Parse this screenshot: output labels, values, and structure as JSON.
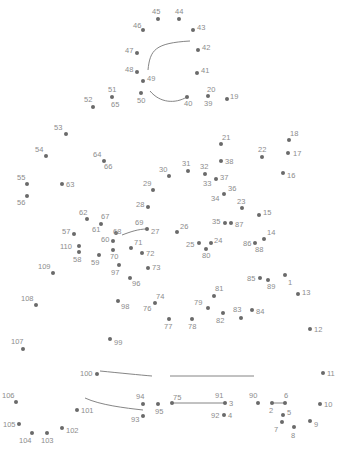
{
  "puzzle": {
    "type": "connect-the-dots",
    "width": 343,
    "height": 451,
    "dot_color": "#6a6a6a",
    "label_color": "#8c8c8c",
    "line_color": "#777777",
    "dots": [
      {
        "n": "1",
        "x": 285,
        "y": 275,
        "lx": 3,
        "ly": 4
      },
      {
        "n": "2",
        "x": 272,
        "y": 403,
        "lx": -3,
        "ly": 4
      },
      {
        "n": "3",
        "x": 225,
        "y": 403,
        "lx": 4,
        "ly": -3
      },
      {
        "n": "4",
        "x": 224,
        "y": 415,
        "lx": 4,
        "ly": -3
      },
      {
        "n": "5",
        "x": 283,
        "y": 415,
        "lx": 4,
        "ly": -6
      },
      {
        "n": "6",
        "x": 285,
        "y": 403,
        "lx": -1,
        "ly": -11
      },
      {
        "n": "7",
        "x": 282,
        "y": 422,
        "lx": -8,
        "ly": 4
      },
      {
        "n": "8",
        "x": 294,
        "y": 427,
        "lx": -3,
        "ly": 5
      },
      {
        "n": "9",
        "x": 310,
        "y": 421,
        "lx": 4,
        "ly": 0
      },
      {
        "n": "10",
        "x": 320,
        "y": 404,
        "lx": 4,
        "ly": -3
      },
      {
        "n": "11",
        "x": 323,
        "y": 373,
        "lx": 4,
        "ly": -3
      },
      {
        "n": "12",
        "x": 310,
        "y": 329,
        "lx": 4,
        "ly": -3
      },
      {
        "n": "13",
        "x": 298,
        "y": 294,
        "lx": 4,
        "ly": -5
      },
      {
        "n": "14",
        "x": 264,
        "y": 239,
        "lx": 3,
        "ly": -10
      },
      {
        "n": "15",
        "x": 259,
        "y": 215,
        "lx": 4,
        "ly": -6
      },
      {
        "n": "16",
        "x": 283,
        "y": 173,
        "lx": 4,
        "ly": -1
      },
      {
        "n": "17",
        "x": 288,
        "y": 153,
        "lx": 5,
        "ly": -3
      },
      {
        "n": "18",
        "x": 289,
        "y": 140,
        "lx": 1,
        "ly": -10
      },
      {
        "n": "19",
        "x": 227,
        "y": 99,
        "lx": 3,
        "ly": -6
      },
      {
        "n": "20",
        "x": 208,
        "y": 96,
        "lx": -1,
        "ly": -10
      },
      {
        "n": "21",
        "x": 221,
        "y": 144,
        "lx": 1,
        "ly": -10
      },
      {
        "n": "22",
        "x": 262,
        "y": 157,
        "lx": -4,
        "ly": -11
      },
      {
        "n": "23",
        "x": 242,
        "y": 208,
        "lx": -5,
        "ly": -10
      },
      {
        "n": "24",
        "x": 211,
        "y": 243,
        "lx": 3,
        "ly": -6
      },
      {
        "n": "25",
        "x": 199,
        "y": 243,
        "lx": -13,
        "ly": -2
      },
      {
        "n": "26",
        "x": 177,
        "y": 232,
        "lx": 3,
        "ly": -9
      },
      {
        "n": "27",
        "x": 147,
        "y": 229,
        "lx": 4,
        "ly": -1
      },
      {
        "n": "28",
        "x": 148,
        "y": 207,
        "lx": -12,
        "ly": -6
      },
      {
        "n": "29",
        "x": 153,
        "y": 190,
        "lx": -10,
        "ly": -10
      },
      {
        "n": "30",
        "x": 169,
        "y": 176,
        "lx": -10,
        "ly": -10
      },
      {
        "n": "31",
        "x": 188,
        "y": 171,
        "lx": -6,
        "ly": -11
      },
      {
        "n": "32",
        "x": 205,
        "y": 174,
        "lx": -5,
        "ly": -11
      },
      {
        "n": "33",
        "x": 216,
        "y": 179,
        "lx": -13,
        "ly": 1
      },
      {
        "n": "34",
        "x": 224,
        "y": 194,
        "lx": -13,
        "ly": 1
      },
      {
        "n": "35",
        "x": 225,
        "y": 223,
        "lx": -13,
        "ly": -5
      },
      {
        "n": "36",
        "x": 224,
        "y": 194,
        "lx": 4,
        "ly": -9
      },
      {
        "n": "37",
        "x": 216,
        "y": 179,
        "lx": 4,
        "ly": -5
      },
      {
        "n": "38",
        "x": 221,
        "y": 161,
        "lx": 4,
        "ly": -3
      },
      {
        "n": "39",
        "x": 208,
        "y": 96,
        "lx": -4,
        "ly": 4
      },
      {
        "n": "40",
        "x": 187,
        "y": 97,
        "lx": -3,
        "ly": 3
      },
      {
        "n": "41",
        "x": 197,
        "y": 73,
        "lx": 4,
        "ly": -6
      },
      {
        "n": "42",
        "x": 198,
        "y": 50,
        "lx": 4,
        "ly": -6
      },
      {
        "n": "43",
        "x": 193,
        "y": 30,
        "lx": 4,
        "ly": -6
      },
      {
        "n": "44",
        "x": 179,
        "y": 19,
        "lx": -4,
        "ly": -11
      },
      {
        "n": "45",
        "x": 158,
        "y": 19,
        "lx": -6,
        "ly": -11
      },
      {
        "n": "46",
        "x": 143,
        "y": 30,
        "lx": -10,
        "ly": -8
      },
      {
        "n": "47",
        "x": 137,
        "y": 53,
        "lx": -12,
        "ly": -6
      },
      {
        "n": "48",
        "x": 137,
        "y": 72,
        "lx": -12,
        "ly": -6
      },
      {
        "n": "49",
        "x": 143,
        "y": 81,
        "lx": 4,
        "ly": -6
      },
      {
        "n": "50",
        "x": 141,
        "y": 93,
        "lx": -4,
        "ly": 4
      },
      {
        "n": "51",
        "x": 112,
        "y": 97,
        "lx": -4,
        "ly": -11
      },
      {
        "n": "52",
        "x": 93,
        "y": 107,
        "lx": -9,
        "ly": -11
      },
      {
        "n": "53",
        "x": 66,
        "y": 134,
        "lx": -12,
        "ly": -10
      },
      {
        "n": "54",
        "x": 46,
        "y": 156,
        "lx": -11,
        "ly": -10
      },
      {
        "n": "55",
        "x": 27,
        "y": 184,
        "lx": -10,
        "ly": -10
      },
      {
        "n": "56",
        "x": 27,
        "y": 196,
        "lx": -10,
        "ly": 3
      },
      {
        "n": "57",
        "x": 74,
        "y": 234,
        "lx": -12,
        "ly": -6
      },
      {
        "n": "58",
        "x": 79,
        "y": 252,
        "lx": -6,
        "ly": 4
      },
      {
        "n": "59",
        "x": 99,
        "y": 255,
        "lx": -8,
        "ly": 4
      },
      {
        "n": "60",
        "x": 113,
        "y": 241,
        "lx": -12,
        "ly": -5
      },
      {
        "n": "61",
        "x": 101,
        "y": 224,
        "lx": -9,
        "ly": 2
      },
      {
        "n": "62",
        "x": 87,
        "y": 219,
        "lx": -8,
        "ly": -10
      },
      {
        "n": "63",
        "x": 62,
        "y": 184,
        "lx": 4,
        "ly": -3
      },
      {
        "n": "64",
        "x": 104,
        "y": 161,
        "lx": -11,
        "ly": -10
      },
      {
        "n": "65",
        "x": 112,
        "y": 97,
        "lx": -1,
        "ly": 4
      },
      {
        "n": "66",
        "x": 104,
        "y": 161,
        "lx": 0,
        "ly": 2
      },
      {
        "n": "67",
        "x": 101,
        "y": 224,
        "lx": 0,
        "ly": -11
      },
      {
        "n": "68",
        "x": 116,
        "y": 233,
        "lx": -3,
        "ly": -5
      },
      {
        "n": "69",
        "x": 147,
        "y": 229,
        "lx": -12,
        "ly": -10
      },
      {
        "n": "70",
        "x": 113,
        "y": 250,
        "lx": -3,
        "ly": 3
      },
      {
        "n": "71",
        "x": 131,
        "y": 248,
        "lx": 3,
        "ly": -9
      },
      {
        "n": "72",
        "x": 142,
        "y": 253,
        "lx": 4,
        "ly": -3
      },
      {
        "n": "73",
        "x": 148,
        "y": 268,
        "lx": 4,
        "ly": -4
      },
      {
        "n": "74",
        "x": 155,
        "y": 303,
        "lx": 1,
        "ly": -10
      },
      {
        "n": "75",
        "x": 172,
        "y": 403,
        "lx": 1,
        "ly": -9
      },
      {
        "n": "76",
        "x": 155,
        "y": 303,
        "lx": -12,
        "ly": 2
      },
      {
        "n": "77",
        "x": 169,
        "y": 319,
        "lx": -5,
        "ly": 4
      },
      {
        "n": "78",
        "x": 192,
        "y": 319,
        "lx": -4,
        "ly": 4
      },
      {
        "n": "79",
        "x": 208,
        "y": 308,
        "lx": -14,
        "ly": -9
      },
      {
        "n": "80",
        "x": 206,
        "y": 249,
        "lx": -4,
        "ly": 3
      },
      {
        "n": "81",
        "x": 214,
        "y": 296,
        "lx": 1,
        "ly": -11
      },
      {
        "n": "82",
        "x": 223,
        "y": 313,
        "lx": -7,
        "ly": 4
      },
      {
        "n": "83",
        "x": 241,
        "y": 318,
        "lx": -8,
        "ly": -12
      },
      {
        "n": "84",
        "x": 252,
        "y": 310,
        "lx": 4,
        "ly": -2
      },
      {
        "n": "85",
        "x": 260,
        "y": 278,
        "lx": -13,
        "ly": -3
      },
      {
        "n": "86",
        "x": 255,
        "y": 243,
        "lx": -12,
        "ly": -3
      },
      {
        "n": "87",
        "x": 231,
        "y": 223,
        "lx": 4,
        "ly": -2
      },
      {
        "n": "88",
        "x": 255,
        "y": 243,
        "lx": 0,
        "ly": 3
      },
      {
        "n": "89",
        "x": 268,
        "y": 280,
        "lx": -1,
        "ly": 3
      },
      {
        "n": "90",
        "x": 258,
        "y": 403,
        "lx": -9,
        "ly": -11
      },
      {
        "n": "91",
        "x": 225,
        "y": 403,
        "lx": -10,
        "ly": -11
      },
      {
        "n": "92",
        "x": 224,
        "y": 415,
        "lx": -13,
        "ly": -3
      },
      {
        "n": "93",
        "x": 143,
        "y": 416,
        "lx": -12,
        "ly": 0
      },
      {
        "n": "94",
        "x": 143,
        "y": 404,
        "lx": -7,
        "ly": -11
      },
      {
        "n": "95",
        "x": 158,
        "y": 404,
        "lx": -3,
        "ly": 4
      },
      {
        "n": "96",
        "x": 130,
        "y": 278,
        "lx": 2,
        "ly": 2
      },
      {
        "n": "97",
        "x": 119,
        "y": 265,
        "lx": -8,
        "ly": 4
      },
      {
        "n": "98",
        "x": 118,
        "y": 301,
        "lx": 3,
        "ly": 2
      },
      {
        "n": "99",
        "x": 110,
        "y": 339,
        "lx": 4,
        "ly": 0
      },
      {
        "n": "100",
        "x": 97,
        "y": 374,
        "lx": -17,
        "ly": -4
      },
      {
        "n": "101",
        "x": 77,
        "y": 410,
        "lx": 4,
        "ly": -3
      },
      {
        "n": "102",
        "x": 62,
        "y": 428,
        "lx": 4,
        "ly": -1
      },
      {
        "n": "103",
        "x": 47,
        "y": 433,
        "lx": -6,
        "ly": 4
      },
      {
        "n": "104",
        "x": 32,
        "y": 433,
        "lx": -13,
        "ly": 4
      },
      {
        "n": "105",
        "x": 19,
        "y": 424,
        "lx": -16,
        "ly": -3
      },
      {
        "n": "106",
        "x": 16,
        "y": 402,
        "lx": -14,
        "ly": -10
      },
      {
        "n": "107",
        "x": 23,
        "y": 349,
        "lx": -12,
        "ly": -11
      },
      {
        "n": "108",
        "x": 36,
        "y": 305,
        "lx": -15,
        "ly": -10
      },
      {
        "n": "109",
        "x": 53,
        "y": 273,
        "lx": -15,
        "ly": -10
      },
      {
        "n": "110",
        "x": 79,
        "y": 246,
        "lx": -19,
        "ly": -3
      }
    ],
    "lines": [
      {
        "d": "M 148 70 C 150 50, 155 43, 190 41"
      },
      {
        "d": "M 150 91 C 160 103, 175 104, 187 97"
      },
      {
        "d": "M 122 235 C 130 232, 138 229, 147 229"
      },
      {
        "d": "M 100 371 C 120 373, 140 375, 152 376"
      },
      {
        "d": "M 170 376 L 254 376"
      },
      {
        "d": "M 85 398 C 100 405, 125 408, 143 410"
      },
      {
        "d": "M 172 403 L 225 403"
      },
      {
        "d": "M 272 403 L 285 403"
      }
    ]
  }
}
